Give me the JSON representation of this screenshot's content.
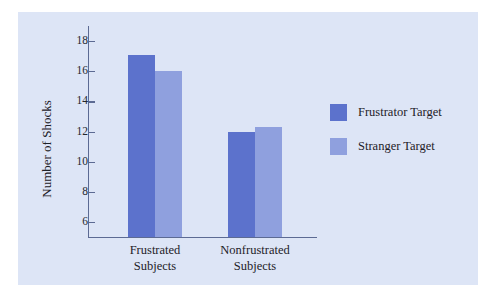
{
  "chart_data": {
    "type": "bar",
    "title": "",
    "xlabel": "",
    "ylabel": "Number of Shocks",
    "categories": [
      "Frustrated Subjects",
      "Nonfrustrated Subjects"
    ],
    "category_lines": [
      [
        "Frustrated",
        "Subjects"
      ],
      [
        "Nonfrustrated",
        "Subjects"
      ]
    ],
    "series": [
      {
        "name": "Frustrator Target",
        "color": "#5c72cc",
        "values": [
          17.1,
          12.0
        ]
      },
      {
        "name": "Stranger Target",
        "color": "#8fa0de",
        "values": [
          16.0,
          12.3
        ]
      }
    ],
    "ylim": [
      5,
      19
    ],
    "yticks": [
      18,
      16,
      14,
      12,
      10,
      8,
      6
    ],
    "ytick_labels": [
      "18",
      "16",
      "14",
      "12",
      "10",
      "8",
      "6"
    ],
    "grid": false,
    "legend_position": "right"
  },
  "figure": {
    "background_color": "#dde5f6",
    "axis_color": "#5c6a93",
    "text_color": "#1d2128"
  }
}
